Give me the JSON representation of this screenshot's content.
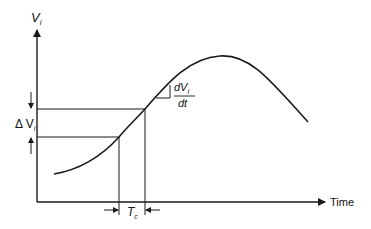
{
  "diagram": {
    "y_axis_label": "V",
    "y_axis_subscript": "i",
    "x_axis_label": "Time",
    "delta_label": "Δ V",
    "delta_subscript": "i",
    "slope_numerator": "dV",
    "slope_numerator_subscript": "i",
    "slope_denominator": "dt",
    "interval_label": "T",
    "interval_subscript": "c"
  },
  "colors": {
    "line": "#1a1a1a",
    "background": "#ffffff"
  }
}
